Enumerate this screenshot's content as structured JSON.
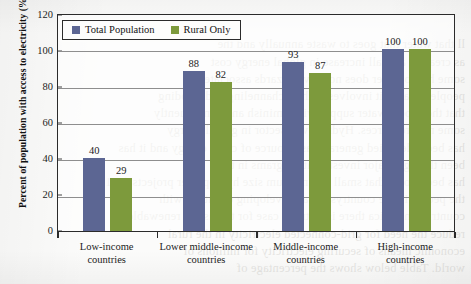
{
  "chart_data": {
    "type": "bar",
    "title": "",
    "xlabel": "",
    "ylabel": "Percent of population with access to electricity (%)",
    "ylim": [
      0,
      120
    ],
    "yticks": [
      0,
      20,
      40,
      60,
      80,
      100,
      120
    ],
    "grid": true,
    "legend_position": "top-left",
    "categories": [
      "Low-income countries",
      "Lower middle-income countries",
      "Middle-income countries",
      "High-income countries"
    ],
    "category_lines": [
      [
        "Low-income",
        "countries"
      ],
      [
        "Lower middle-income",
        "countries"
      ],
      [
        "Middle-income",
        "countries"
      ],
      [
        "High-income",
        "countries"
      ]
    ],
    "series": [
      {
        "name": "Total Population",
        "color": "#5c6693",
        "values": [
          40,
          88,
          93,
          100
        ]
      },
      {
        "name": "Rural Only",
        "color": "#7d9a3c",
        "values": [
          29,
          82,
          87,
          100
        ]
      }
    ]
  },
  "legend": {
    "items": [
      {
        "label": "Total Population",
        "color": "#5c6693"
      },
      {
        "label": "Rural Only",
        "color": "#7d9a3c"
      }
    ]
  },
  "axis": {
    "y_tick_labels": [
      "120",
      "100",
      "80",
      "60",
      "40",
      "20",
      "0"
    ],
    "y_axis_title": "Percent of population with access to electricity (%)"
  },
  "bleed_text": {
    "top": "ll that water that goes to waste annually and the\nas creating a small increase in global energy cost\nsome hydropower does not have hazards associated\npeople because it involves both re-channeling and flooding\nthat their local water supply will diminish and consequently\nsome new resources. Hydropower sector in global energy\nhas been identified generally as a source of clean energy and it has\nbeen through major investment programs in the\nhas been noted that small and medium size hydropower projects (2–15\nthe people in the countryside, as developing countries with\ncountries in Africa there is a strong case for the use of renewable\nreduce the need for grid-connected electricity in the rural\neconomic means of securing electricity for millions of\nworld. Table below shows the percentage of\n",
    "bottom": "which is suitable for small hydro development, its contribution\ndistribution of hydropower is largely limited and effectively four-fifths"
  }
}
